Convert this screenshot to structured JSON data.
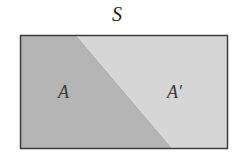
{
  "diagram": {
    "universe_label": "S",
    "regions": [
      {
        "label": "A",
        "color": "#b4b4b4"
      },
      {
        "label": "A′",
        "color": "#d6d6d6"
      }
    ],
    "border_color": "#3c3c3c"
  }
}
